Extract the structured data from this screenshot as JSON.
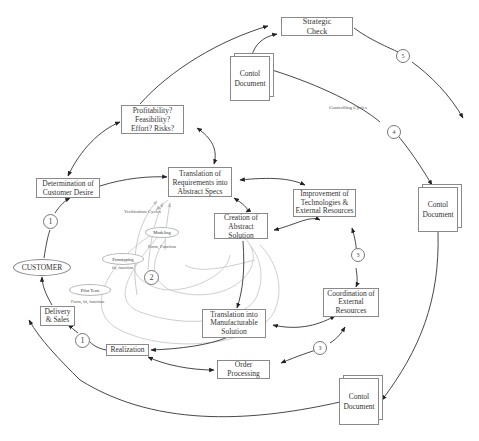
{
  "diagram": {
    "type": "process-cycle-diagram",
    "colors": {
      "line": "#333333",
      "box_border": "#8a8a8a",
      "faint_line": "#c8c8c8",
      "background": "#ffffff"
    },
    "nodes": {
      "strategic_check": "Strategic\nCheck",
      "control_document_top": "Contol\nDocument",
      "profitability": "Profitability?\nFeasibility?\nEffort? Risks?",
      "translation_requirements": "Translation of\nRequirements into\nAbstract Specs",
      "determination_customer_desire": "Determination of\nCustomer Desire",
      "improvement_technologies": "Improvement of\nTechnologies &\nExternal Resources",
      "control_document_right": "Contol\nDocument",
      "creation_abstract_solution": "Creation of\nAbstract Solution",
      "customer": "CUSTOMER",
      "coordination_external": "Coordination of\nExternal\nResources",
      "translation_manufacturable": "Translation into\nManufacturable\nSolution",
      "delivery_sales": "Delivery\n& Sales",
      "realization": "Realization",
      "order_processing": "Order\nProcessing",
      "control_document_bottom": "Contol\nDocument"
    },
    "verification": {
      "title": "Verification Cycles",
      "modeling": "Modeling",
      "modeling_note": "Form, Function",
      "prototyping": "Prototyping",
      "prototyping_note": "fit, function",
      "pilot_tests": "Pilot Tests",
      "pilot_note": "Form, fit, function"
    },
    "controlling_label": "Controlling Cycles",
    "cycle_markers": {
      "c1_upper": "1",
      "c1_lower": "1",
      "c2": "2",
      "c3_upper": "3",
      "c3_lower": "3",
      "c4": "4",
      "c5": "5"
    }
  }
}
